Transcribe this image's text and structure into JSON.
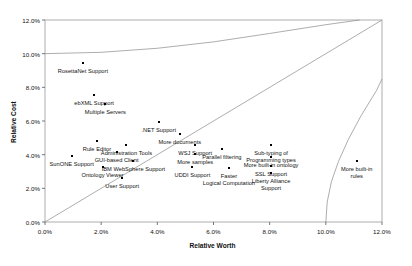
{
  "chart_data": {
    "type": "scatter",
    "title": "",
    "xlabel": "Relative Worth",
    "ylabel": "Relative Cost",
    "xlim": [
      0.0,
      12.0
    ],
    "ylim": [
      0.0,
      12.0
    ],
    "xticks": [
      "0.0%",
      "2.0%",
      "4.0%",
      "6.0%",
      "8.0%",
      "10.0%",
      "12.0%"
    ],
    "xtick_values": [
      0.0,
      2.0,
      4.0,
      6.0,
      8.0,
      10.0,
      12.0
    ],
    "yticks": [
      "0.0%",
      "2.0%",
      "4.0%",
      "6.0%",
      "8.0%",
      "10.0%",
      "12.0%"
    ],
    "ytick_values": [
      0.0,
      2.0,
      4.0,
      6.0,
      8.0,
      10.0,
      12.0
    ],
    "grid": false,
    "legend": "none",
    "points": [
      {
        "label": "RosettaNet Support",
        "x": 1.35,
        "y": 9.45,
        "label_dy": 5.0,
        "lines": [
          "RosettaNet Support"
        ]
      },
      {
        "label": "ebXML Support",
        "x": 1.75,
        "y": 7.55,
        "label_dy": 5.0,
        "lines": [
          "ebXML Support"
        ]
      },
      {
        "label": "Multiple Servers",
        "x": 2.15,
        "y": 7.0,
        "label_dy": 5.0,
        "lines": [
          "Multiple Servers"
        ]
      },
      {
        "label": ".NET Support",
        "x": 4.05,
        "y": 5.95,
        "label_dy": 5.0,
        "lines": [
          ".NET Support"
        ]
      },
      {
        "label": "More documents",
        "x": 4.8,
        "y": 5.25,
        "label_dy": 5.0,
        "lines": [
          "More documents"
        ]
      },
      {
        "label": "Rule Editor",
        "x": 1.85,
        "y": 4.8,
        "label_dy": 5.0,
        "lines": [
          "Rule Editor"
        ]
      },
      {
        "label": "Administration Tools",
        "x": 2.9,
        "y": 4.55,
        "label_dy": 5.0,
        "lines": [
          "Administration Tools"
        ]
      },
      {
        "label": "WSJ Support",
        "x": 5.35,
        "y": 4.55,
        "label_dy": 5.0,
        "lines": [
          "WSJ Support"
        ]
      },
      {
        "label": "Parallel filtering",
        "x": 6.3,
        "y": 4.35,
        "label_dy": 5.0,
        "lines": [
          "Parallel filtering"
        ]
      },
      {
        "label": "GUI-based Client",
        "x": 2.55,
        "y": 4.15,
        "label_dy": 5.0,
        "lines": [
          "GUI-based Client"
        ]
      },
      {
        "label": "More samples",
        "x": 5.35,
        "y": 4.05,
        "label_dy": 5.0,
        "lines": [
          "More samples"
        ]
      },
      {
        "label": "Sub-typing of Programming types",
        "x": 8.05,
        "y": 4.55,
        "label_dy": 5.0,
        "lines": [
          "Sub-typing of",
          "Programming types"
        ]
      },
      {
        "label": "More built-in ontology",
        "x": 8.05,
        "y": 3.85,
        "label_dy": 5.0,
        "lines": [
          "More built-in ontology"
        ]
      },
      {
        "label": "SunONE Support",
        "x": 0.95,
        "y": 3.9,
        "label_dy": 5.0,
        "lines": [
          "SunONE Support"
        ]
      },
      {
        "label": "IBM WebSphere Support",
        "x": 3.15,
        "y": 3.6,
        "label_dy": 5.0,
        "lines": [
          "IBM WebSphere Support"
        ]
      },
      {
        "label": "More built-in rules",
        "x": 11.1,
        "y": 3.6,
        "label_dy": 5.0,
        "lines": [
          "More built-in",
          "rules"
        ]
      },
      {
        "label": "SSL Support",
        "x": 8.05,
        "y": 3.35,
        "label_dy": 5.0,
        "lines": [
          "SSL Support"
        ]
      },
      {
        "label": "Ontology Viewer",
        "x": 2.05,
        "y": 3.25,
        "label_dy": 5.0,
        "lines": [
          "Ontology Viewer"
        ]
      },
      {
        "label": "UDDI Support",
        "x": 5.25,
        "y": 3.25,
        "label_dy": 5.0,
        "lines": [
          "UDDI Support"
        ]
      },
      {
        "label": "Faster Logical Computation",
        "x": 6.55,
        "y": 3.2,
        "label_dy": 5.0,
        "lines": [
          "Faster",
          "Logical Computation"
        ]
      },
      {
        "label": "Liberty Alliance Support",
        "x": 8.05,
        "y": 2.9,
        "label_dy": 5.0,
        "lines": [
          "Liberty Alliance",
          "Support"
        ]
      },
      {
        "label": "User Support",
        "x": 2.75,
        "y": 2.6,
        "label_dy": 5.0,
        "lines": [
          "User Support"
        ]
      }
    ],
    "reference_lines": [
      {
        "name": "diagonal-parity-line",
        "type": "line",
        "from": [
          0.0,
          0.0
        ],
        "to": [
          12.0,
          12.0
        ]
      },
      {
        "name": "upper-cost-curve",
        "type": "curve",
        "points": [
          [
            0.0,
            10.0
          ],
          [
            2.0,
            10.08
          ],
          [
            4.0,
            10.32
          ],
          [
            6.0,
            10.7
          ],
          [
            8.0,
            11.2
          ],
          [
            10.0,
            11.72
          ],
          [
            11.2,
            12.0
          ]
        ]
      },
      {
        "name": "lower-worth-curve",
        "type": "curve",
        "points": [
          [
            10.0,
            0.0
          ],
          [
            10.05,
            1.2
          ],
          [
            10.2,
            2.4
          ],
          [
            10.45,
            3.6
          ],
          [
            10.8,
            4.9
          ],
          [
            11.25,
            6.3
          ],
          [
            11.8,
            7.8
          ],
          [
            12.0,
            8.5
          ]
        ]
      }
    ]
  }
}
